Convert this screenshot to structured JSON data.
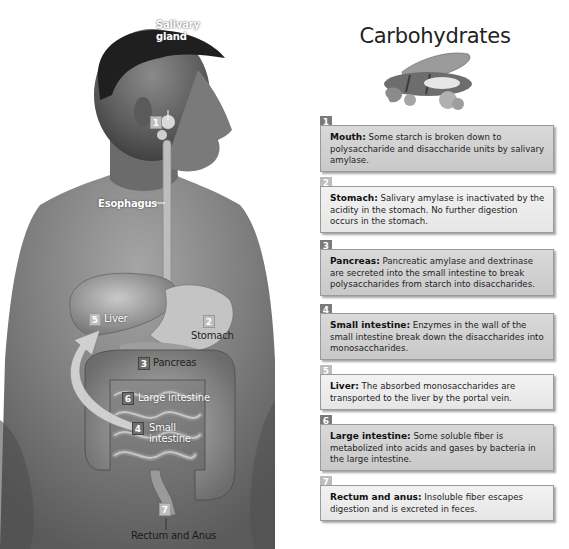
{
  "title": "Carbohydrates",
  "figure": {
    "labels": {
      "salivary_gland": "Salivary gland",
      "salivary_gland_line1": "Salivary",
      "salivary_gland_line2": "gland",
      "esophagus": "Esophagus",
      "liver": "Liver",
      "stomach": "Stomach",
      "pancreas": "Pancreas",
      "large_intestine": "Large intestine",
      "small_intestine_line1": "Small",
      "small_intestine_line2": "intestine",
      "rectum_anus": "Rectum and Anus"
    },
    "badges": {
      "salivary": "1",
      "stomach": "2",
      "pancreas": "3",
      "small_intestine": "4",
      "liver": "5",
      "large_intestine": "6",
      "rectum": "7"
    }
  },
  "food_image": "bread-pasta-rice-icon",
  "steps": [
    {
      "number": "1",
      "organ": "Mouth:",
      "text": " Some starch is broken down to polysaccharide and disaccharide units by salivary amylase.",
      "shade": "dark"
    },
    {
      "number": "2",
      "organ": "Stomach:",
      "text": " Salivary amylase is inactivated by the acidity in the stomach. No further digestion occurs in the stomach.",
      "shade": "light"
    },
    {
      "number": "3",
      "organ": "Pancreas:",
      "text": " Pancreatic amylase and dextrinase are secreted into the small intestine to break polysaccharides from starch into disaccharides.",
      "shade": "dark"
    },
    {
      "number": "4",
      "organ": "Small intestine:",
      "text": " Enzymes in the wall of the small intestine break down the disaccharides into monosaccharides.",
      "shade": "dark"
    },
    {
      "number": "5",
      "organ": "Liver:",
      "text": " The absorbed monosaccharides are transported to the liver by the portal vein.",
      "shade": "light"
    },
    {
      "number": "6",
      "organ": "Large intestine:",
      "text": " Some soluble fiber is metabolized into acids and gases by bacteria in the large intestine.",
      "shade": "dark"
    },
    {
      "number": "7",
      "organ": "Rectum and anus:",
      "text": " Insoluble fiber escapes digestion and is excreted in feces.",
      "shade": "light"
    }
  ],
  "colors": {
    "dark_box": "#d0d0d0",
    "light_box": "#ececec",
    "dark_badge": "#7a7a7a",
    "light_badge": "#bcbcbc",
    "border": "#9a9a9a"
  }
}
